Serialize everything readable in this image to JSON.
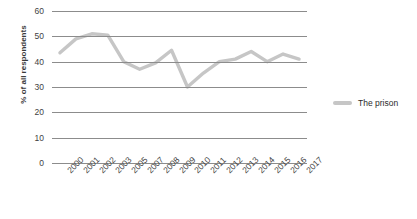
{
  "chart_data": {
    "type": "line",
    "title": "",
    "xlabel": "",
    "ylabel": "% of all respondents",
    "categories": [
      "2000",
      "2001",
      "2002",
      "2003",
      "2005",
      "2007",
      "2008",
      "2009",
      "2010",
      "2011",
      "2012",
      "2013",
      "2014",
      "2015",
      "2016",
      "2017"
    ],
    "series": [
      {
        "name": "The prison",
        "color": "#c6c6c6",
        "values": [
          43.5,
          49,
          51,
          50.5,
          40,
          37,
          39.5,
          44.5,
          30,
          35.5,
          40,
          41,
          44,
          40,
          43,
          41
        ]
      }
    ],
    "ylim": [
      0,
      60
    ],
    "yticks": [
      0,
      10,
      20,
      30,
      40,
      50,
      60
    ],
    "grid": true,
    "legend_position": "right"
  },
  "legend": {
    "items": [
      {
        "label": "The prison"
      }
    ]
  }
}
